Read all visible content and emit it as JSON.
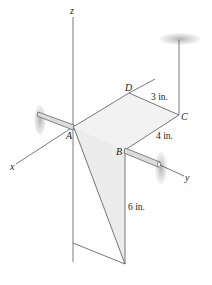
{
  "diagram": {
    "axes": {
      "x": "x",
      "y": "y",
      "z": "z"
    },
    "points": {
      "A": "A",
      "B": "B",
      "C": "C",
      "D": "D"
    },
    "dimensions": {
      "dc": "3 in.",
      "cb": "4 in.",
      "vertical": "6 in."
    },
    "colors": {
      "line": "#555555",
      "plate_fill": "#efefef",
      "shadow": "#b8b8b8",
      "rod_fill": "#d9d9d9"
    }
  }
}
